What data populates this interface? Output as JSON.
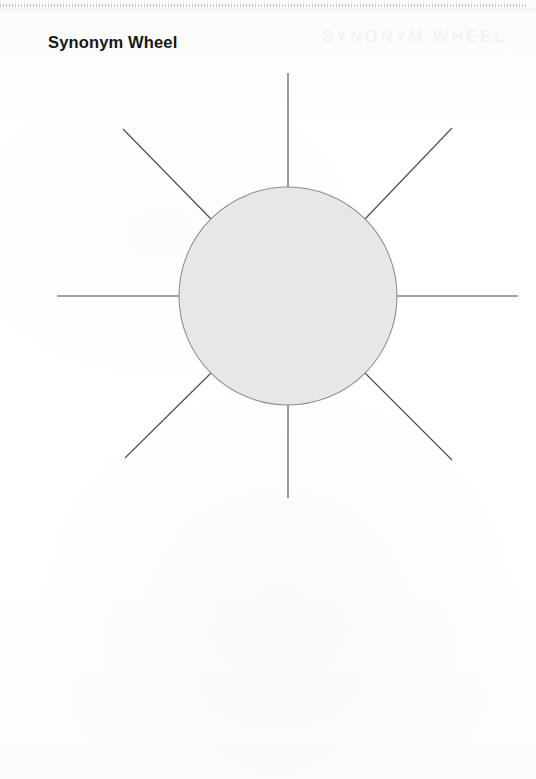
{
  "page": {
    "width": 536,
    "height": 779,
    "background_color": "#fdfdfd",
    "top_rule_color": "#96969b"
  },
  "worksheet": {
    "title": "Synonym Wheel",
    "title_color": "#171717"
  },
  "ghost_text": {
    "label": "SYNONYM WHEEL"
  },
  "diagram": {
    "name": "synonym-wheel",
    "center": {
      "x": 288,
      "y": 296
    },
    "circle": {
      "radius": 109,
      "fill_color": "#e7e7e7",
      "stroke_color": "#8f8f8f",
      "stroke_width": 1.1
    },
    "spoke": {
      "stroke_color": "#4a4a4a",
      "stroke_width": 1.1,
      "count": 8,
      "outer_radius": 231
    },
    "spokes": [
      {
        "name": "spoke-n",
        "angle_deg": 270,
        "x1": 288,
        "y1": 187,
        "x2": 288,
        "y2": 73
      },
      {
        "name": "spoke-ne",
        "angle_deg": 315,
        "x1": 365,
        "y1": 219,
        "x2": 452,
        "y2": 128
      },
      {
        "name": "spoke-e",
        "angle_deg": 0,
        "x1": 397,
        "y1": 296,
        "x2": 518,
        "y2": 296
      },
      {
        "name": "spoke-se",
        "angle_deg": 45,
        "x1": 365,
        "y1": 373,
        "x2": 452,
        "y2": 460
      },
      {
        "name": "spoke-s",
        "angle_deg": 90,
        "x1": 288,
        "y1": 405,
        "x2": 288,
        "y2": 498
      },
      {
        "name": "spoke-sw",
        "angle_deg": 135,
        "x1": 211,
        "y1": 373,
        "x2": 125,
        "y2": 458
      },
      {
        "name": "spoke-w",
        "angle_deg": 180,
        "x1": 179,
        "y1": 296,
        "x2": 57,
        "y2": 296
      },
      {
        "name": "spoke-nw",
        "angle_deg": 225,
        "x1": 211,
        "y1": 219,
        "x2": 123,
        "y2": 129
      }
    ]
  }
}
